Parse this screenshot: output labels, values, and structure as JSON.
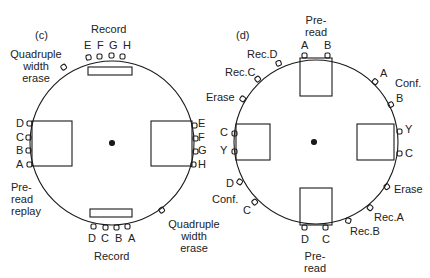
{
  "panel_c": {
    "tag": "(c)",
    "record_top": "Record",
    "heads_top": [
      "E",
      "F",
      "G",
      "H"
    ],
    "quad_erase_top": [
      "Quadruple",
      "width",
      "erase"
    ],
    "heads_left": [
      "D",
      "C",
      "B",
      "A"
    ],
    "heads_right": [
      "E",
      "F",
      "G",
      "H"
    ],
    "preread_replay": [
      "Pre-",
      "read",
      "replay"
    ],
    "heads_bottom": [
      "D",
      "C",
      "B",
      "A"
    ],
    "record_bottom": "Record",
    "quad_erase_bottom": [
      "Quadruple",
      "width",
      "erase"
    ]
  },
  "panel_d": {
    "tag": "(d)",
    "preread_top": [
      "Pre-",
      "read"
    ],
    "heads_top": [
      "A",
      "B"
    ],
    "rec_d": "Rec.D",
    "rec_c": "Rec.C",
    "erase_left": "Erase",
    "conf_top": "Conf.",
    "conf_top_heads": [
      "A",
      "B"
    ],
    "heads_left": [
      "C",
      "Y"
    ],
    "heads_right": [
      "Y",
      "C"
    ],
    "conf_bottom": "Conf.",
    "conf_bottom_heads": [
      "D",
      "C"
    ],
    "erase_right": "Erase",
    "rec_a": "Rec.A",
    "rec_b": "Rec.B",
    "heads_bottom": [
      "D",
      "C"
    ],
    "preread_bottom": [
      "Pre-",
      "read"
    ]
  }
}
